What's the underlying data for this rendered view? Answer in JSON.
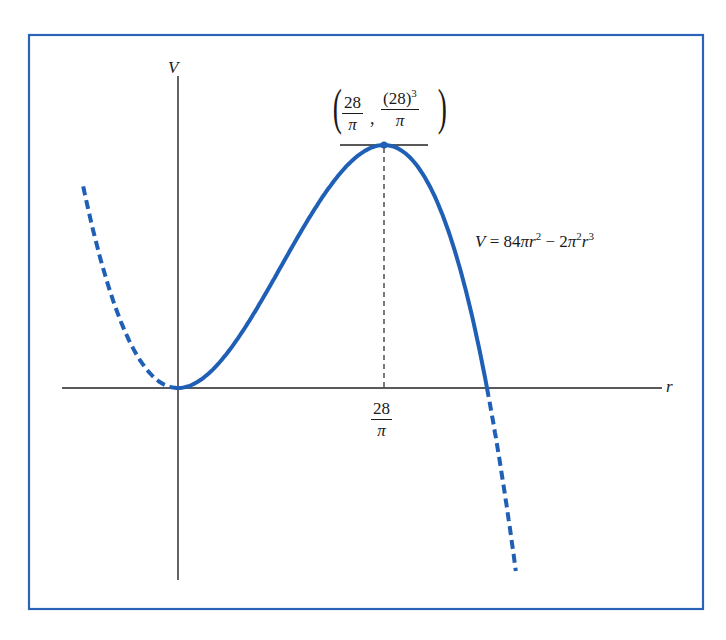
{
  "figure": {
    "frame_color": "#2b63b8",
    "curve_color": "#1f5fb5",
    "axis_color": "#222222",
    "axes": {
      "vertical_label": "V",
      "horizontal_label": "r"
    },
    "equation": {
      "lhs": "V",
      "equals": "=",
      "coef1": "84",
      "pi1": "π",
      "var1": "r",
      "exp1": "2",
      "minus": "−",
      "coef2": "2",
      "pi2": "π",
      "pi2_exp": "2",
      "var2": "r",
      "exp2": "3",
      "full_text": "V = 84πr² − 2π²r³"
    },
    "max_point": {
      "x_num": "28",
      "x_den": "π",
      "y_num": "(28)",
      "y_num_exp": "3",
      "y_den": "π",
      "separator": ",",
      "open_paren": "(",
      "close_paren": ")"
    },
    "tick_label": {
      "num": "28",
      "den": "π"
    },
    "curve_segments": [
      {
        "style": "dashed",
        "domain": "r < 0"
      },
      {
        "style": "solid",
        "domain": "0 ≤ r ≤ 42/π"
      },
      {
        "style": "dashed",
        "domain": "r > 42/π"
      }
    ]
  }
}
